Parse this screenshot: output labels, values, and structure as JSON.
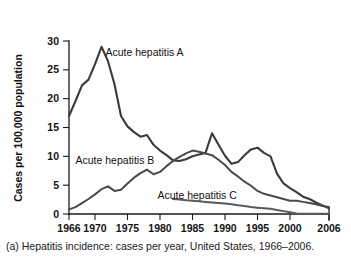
{
  "figure": {
    "caption": "(a) Hepatitis incidence: cases per year, United States, 1966–2006."
  },
  "chart_data": {
    "type": "line",
    "title": "",
    "subtitle": "",
    "xlabel": "",
    "ylabel": "Cases per 100,000 population",
    "xlim": [
      1966,
      2006
    ],
    "ylim": [
      0,
      30
    ],
    "grid": false,
    "legend_position": "inline-annotations",
    "xticks": [
      1966,
      1970,
      1975,
      1980,
      1985,
      1990,
      1995,
      2000,
      2006
    ],
    "xtick_labels": [
      "1966",
      "1970",
      "1975",
      "1980",
      "1985",
      "1990",
      "1995",
      "2000",
      "2006"
    ],
    "yticks": [
      0,
      5,
      10,
      15,
      20,
      25,
      30
    ],
    "ytick_labels": [
      "0",
      "5",
      "10",
      "15",
      "20",
      "25",
      "30"
    ],
    "annotations": [
      {
        "text": "Acute hepatitis A",
        "x": 1971.6,
        "y": 27.4
      },
      {
        "text": "Acute hepatitis B",
        "x": 1967.0,
        "y": 8.6
      },
      {
        "text": "Acute hepatitis C",
        "x": 1979.6,
        "y": 2.6
      }
    ],
    "series": [
      {
        "name": "Acute hepatitis A",
        "color": "#3b3b3b",
        "x": [
          1966,
          1967,
          1968,
          1969,
          1970,
          1971,
          1972,
          1973,
          1974,
          1975,
          1976,
          1977,
          1978,
          1979,
          1980,
          1981,
          1982,
          1983,
          1984,
          1985,
          1986,
          1987,
          1988,
          1989,
          1990,
          1991,
          1992,
          1993,
          1994,
          1995,
          1996,
          1997,
          1998,
          1999,
          2000,
          2001,
          2002,
          2003,
          2004,
          2005,
          2006
        ],
        "values": [
          17.0,
          19.6,
          22.3,
          23.3,
          26.0,
          29.0,
          26.5,
          22.5,
          17.0,
          15.2,
          14.2,
          13.4,
          13.7,
          12.0,
          11.0,
          10.2,
          9.3,
          9.2,
          9.5,
          10.0,
          10.3,
          10.6,
          14.0,
          12.0,
          10.1,
          8.7,
          9.0,
          10.2,
          11.2,
          11.5,
          10.6,
          10.0,
          7.0,
          5.3,
          4.5,
          3.8,
          3.0,
          2.6,
          2.0,
          1.5,
          1.0
        ]
      },
      {
        "name": "Acute hepatitis B",
        "color": "#4a4a4a",
        "x": [
          1966,
          1967,
          1968,
          1969,
          1970,
          1971,
          1972,
          1973,
          1974,
          1975,
          1976,
          1977,
          1978,
          1979,
          1980,
          1981,
          1982,
          1983,
          1984,
          1985,
          1986,
          1987,
          1988,
          1989,
          1990,
          1991,
          1992,
          1993,
          1994,
          1995,
          1996,
          1997,
          1998,
          1999,
          2000,
          2001,
          2002,
          2003,
          2004,
          2005,
          2006
        ],
        "values": [
          0.8,
          1.2,
          1.9,
          2.6,
          3.4,
          4.3,
          4.8,
          4.0,
          4.2,
          5.3,
          6.3,
          7.1,
          7.7,
          6.9,
          7.3,
          8.3,
          9.2,
          9.9,
          10.5,
          11.0,
          10.8,
          10.5,
          10.2,
          9.4,
          8.5,
          7.3,
          6.5,
          5.6,
          4.9,
          4.0,
          3.5,
          3.2,
          2.9,
          2.6,
          2.3,
          2.3,
          2.1,
          1.9,
          1.7,
          1.4,
          1.2
        ]
      },
      {
        "name": "Acute hepatitis C",
        "color": "#5a5a5a",
        "x": [
          1982,
          1983,
          1984,
          1985,
          1986,
          1987,
          1988,
          1989,
          1990,
          1991,
          1992,
          1993,
          1994,
          1995,
          1996,
          1997,
          1998,
          1999,
          2000,
          2001,
          2002,
          2003,
          2004,
          2005,
          2006
        ],
        "values": [
          2.6,
          2.5,
          2.4,
          2.3,
          2.2,
          2.1,
          2.0,
          1.9,
          1.8,
          1.7,
          1.5,
          1.4,
          1.2,
          1.1,
          1.0,
          0.9,
          0.7,
          0.5,
          0.3,
          0.1,
          0.05,
          0.05,
          0.05,
          0.05,
          0.05
        ]
      }
    ]
  }
}
